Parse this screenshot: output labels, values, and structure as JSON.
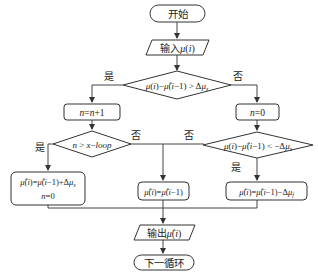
{
  "diagram": {
    "type": "flowchart",
    "nodes": {
      "start": {
        "label": "开始",
        "shape": "terminal"
      },
      "input": {
        "label": "输入μ(i)",
        "shape": "parallelogram"
      },
      "decision1": {
        "label": "μ(i)−μ̂(i−1) > Δμs",
        "shape": "diamond"
      },
      "inc_n": {
        "label": "n=n+1",
        "shape": "rounded-rect"
      },
      "reset_n": {
        "label": "n=0",
        "shape": "rounded-rect"
      },
      "decision2": {
        "label": "n > x−loop",
        "shape": "diamond"
      },
      "decision3": {
        "label": "μ(i)−μ̂(i−1) < −Δμs",
        "shape": "diamond"
      },
      "update_up": {
        "label_line1": "μ̂(i)=μ̂(i−1)+Δμs",
        "label_line2": "n=0",
        "shape": "rounded-rect"
      },
      "hold": {
        "label": "μ̂(i)=μ̂(i−1)",
        "shape": "rounded-rect"
      },
      "update_down": {
        "label": "μ̂(i)=μ̂(i−1)−Δμf",
        "shape": "rounded-rect"
      },
      "output": {
        "label": "输出μ̂(i)",
        "shape": "parallelogram"
      },
      "next": {
        "label": "下一循环",
        "shape": "terminal"
      }
    },
    "edge_labels": {
      "d1_yes": "是",
      "d1_no": "否",
      "d2_yes": "是",
      "d2_no": "否",
      "d3_no": "否",
      "d3_yes": "是"
    },
    "colors": {
      "stroke": "#333333",
      "text": "#222222",
      "background": "#ffffff"
    }
  }
}
